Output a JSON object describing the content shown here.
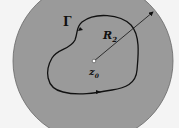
{
  "diagram": {
    "disk_color": "#9a9a9a",
    "background": "#f4f4f4",
    "labels": {
      "curve": "Γ",
      "radius": "R",
      "radius_sub": "2",
      "center": "z",
      "center_sub": "0"
    }
  }
}
